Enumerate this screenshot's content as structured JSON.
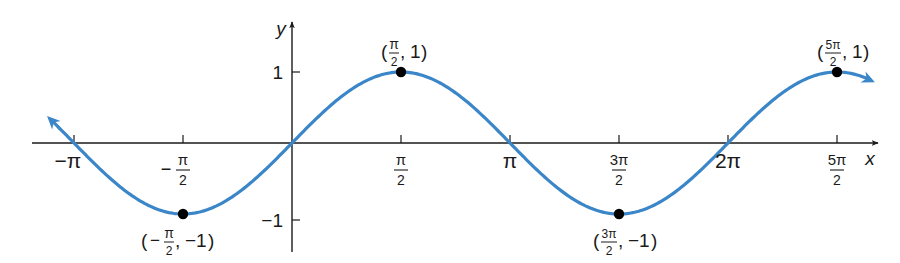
{
  "chart_data": {
    "type": "line",
    "title": "",
    "function": "y = sin x",
    "xlabel": "x",
    "ylabel": "y",
    "xlim": [
      -3.1416,
      7.854
    ],
    "ylim": [
      -1,
      1
    ],
    "grid": false,
    "legend": null,
    "x_ticks": [
      {
        "value": -3.1416,
        "label": "−π",
        "type": "simple"
      },
      {
        "value": -1.5708,
        "label": "−π/2",
        "type": "fraction",
        "sign": "−",
        "num": "π",
        "den": "2"
      },
      {
        "value": 1.5708,
        "label": "π/2",
        "type": "fraction",
        "sign": "",
        "num": "π",
        "den": "2"
      },
      {
        "value": 3.1416,
        "label": "π",
        "type": "simple"
      },
      {
        "value": 4.7124,
        "label": "3π/2",
        "type": "fraction",
        "sign": "",
        "num": "3π",
        "den": "2"
      },
      {
        "value": 6.2832,
        "label": "2π",
        "type": "simple"
      },
      {
        "value": 7.854,
        "label": "5π/2",
        "type": "fraction",
        "sign": "",
        "num": "5π",
        "den": "2"
      }
    ],
    "y_ticks": [
      {
        "value": 1,
        "label": "1"
      },
      {
        "value": -1,
        "label": "−1"
      }
    ],
    "labeled_points": [
      {
        "x": -1.5708,
        "y": -1,
        "label": "(−π/2, −1)",
        "xnum": "π",
        "xden": "2",
        "xsign": "−",
        "ytext": "−1",
        "pos": "below"
      },
      {
        "x": 1.5708,
        "y": 1,
        "label": "(π/2, 1)",
        "xnum": "π",
        "xden": "2",
        "xsign": "",
        "ytext": "1",
        "pos": "above"
      },
      {
        "x": 4.7124,
        "y": -1,
        "label": "(3π/2, −1)",
        "xnum": "3π",
        "xden": "2",
        "xsign": "",
        "ytext": "−1",
        "pos": "below"
      },
      {
        "x": 7.854,
        "y": 1,
        "label": "(5π/2, 1)",
        "xnum": "5π",
        "xden": "2",
        "xsign": "",
        "ytext": "1",
        "pos": "above"
      }
    ],
    "series": [
      {
        "name": "sin x",
        "x_range": [
          -3.45,
          8.32
        ],
        "color": "#3a86c8",
        "arrows": "both ends"
      }
    ]
  },
  "colors": {
    "curve": "#3a86c8",
    "axis": "#1a1a1a",
    "point": "#000000"
  }
}
